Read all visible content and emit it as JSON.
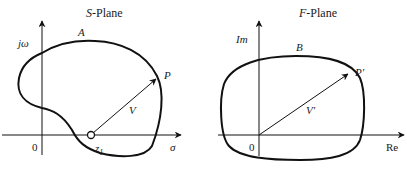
{
  "s_plane": {
    "title_italic": "S",
    "title_rest": "-Plane",
    "vertical_axis_label": "jω",
    "horizontal_axis_label": "σ",
    "origin_label": "0",
    "contour_label": "A",
    "point_label": "P",
    "vector_label": "V",
    "zero_label_base": "z",
    "zero_label_sub": "1"
  },
  "f_plane": {
    "title_italic": "F",
    "title_rest": "-Plane",
    "vertical_axis_label": "Im",
    "horizontal_axis_label": "Re",
    "origin_label": "0",
    "contour_label": "B",
    "point_label": "P'",
    "vector_label": "V'"
  },
  "colors": {
    "stroke": "#111111",
    "background": "#ffffff"
  }
}
